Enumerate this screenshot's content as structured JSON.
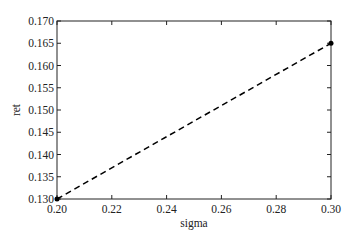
{
  "chart_data": {
    "type": "line",
    "title": "",
    "xlabel": "sigma",
    "ylabel": "ret",
    "xlim": [
      0.2,
      0.3
    ],
    "ylim": [
      0.13,
      0.17
    ],
    "xticks": [
      0.2,
      0.22,
      0.24,
      0.26,
      0.28,
      0.3
    ],
    "xtick_labels": [
      "0.20",
      "0.22",
      "0.24",
      "0.26",
      "0.28",
      "0.30"
    ],
    "yticks": [
      0.13,
      0.135,
      0.14,
      0.145,
      0.15,
      0.155,
      0.16,
      0.165,
      0.17
    ],
    "ytick_labels": [
      "0.130",
      "0.135",
      "0.140",
      "0.145",
      "0.150",
      "0.155",
      "0.160",
      "0.165",
      "0.170"
    ],
    "grid": false,
    "legend": null,
    "series": [
      {
        "name": "dashed-line",
        "style": "dashed",
        "color": "#000000",
        "x": [
          0.2,
          0.3
        ],
        "y": [
          0.13,
          0.165
        ],
        "markers": "dot-at-endpoints"
      }
    ]
  },
  "colors": {
    "line": "#000000",
    "axes": "#222222",
    "background": "#ffffff"
  }
}
